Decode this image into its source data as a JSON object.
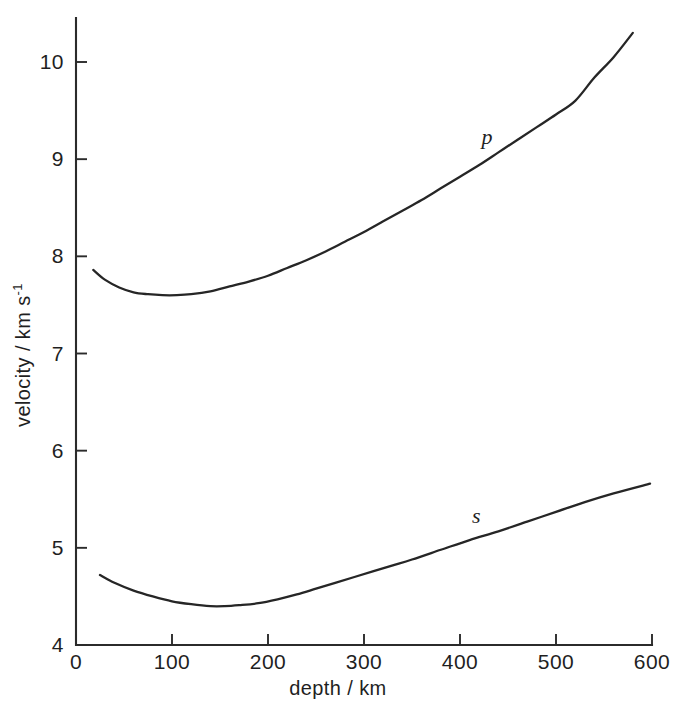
{
  "chart_data": {
    "type": "line",
    "title": "",
    "xlabel": "depth / km",
    "ylabel_main": "velocity / km s",
    "ylabel_exponent": "-1",
    "xlim": [
      0,
      600
    ],
    "ylim": [
      4,
      10.4
    ],
    "xticks": [
      0,
      100,
      200,
      300,
      400,
      500,
      600
    ],
    "xtick_labels": [
      "0",
      "100",
      "200",
      "300",
      "400",
      "500",
      "600"
    ],
    "yticks": [
      4,
      5,
      6,
      7,
      8,
      9,
      10
    ],
    "ytick_labels": [
      "4",
      "5",
      "6",
      "7",
      "8",
      "9",
      "10"
    ],
    "grid": false,
    "legend": "inline-annotations",
    "line_color": "#262626",
    "axis_color": "#2b2b2b",
    "background_color": "#ffffff",
    "annotations": [
      {
        "text": "p",
        "x": 428,
        "y": 9.16,
        "style": "italic"
      },
      {
        "text": "s",
        "x": 417,
        "y": 5.26,
        "style": "italic"
      }
    ],
    "series": [
      {
        "name": "p",
        "label": "p",
        "description": "P-wave velocity versus depth",
        "x": [
          18,
          30,
          45,
          60,
          75,
          90,
          105,
          120,
          140,
          160,
          180,
          200,
          220,
          240,
          260,
          280,
          300,
          320,
          340,
          360,
          380,
          400,
          420,
          440,
          460,
          480,
          500,
          520,
          540,
          560,
          580
        ],
        "y": [
          7.86,
          7.76,
          7.68,
          7.63,
          7.61,
          7.6,
          7.6,
          7.61,
          7.64,
          7.69,
          7.74,
          7.8,
          7.88,
          7.96,
          8.05,
          8.15,
          8.25,
          8.36,
          8.47,
          8.58,
          8.7,
          8.82,
          8.94,
          9.07,
          9.2,
          9.33,
          9.46,
          9.6,
          9.84,
          10.05,
          10.3
        ]
      },
      {
        "name": "s",
        "label": "s",
        "description": "S-wave velocity versus depth",
        "x": [
          25,
          40,
          60,
          80,
          100,
          120,
          140,
          155,
          170,
          190,
          210,
          230,
          250,
          270,
          290,
          310,
          330,
          350,
          380,
          410,
          440,
          470,
          500,
          530,
          560,
          598
        ],
        "y": [
          4.72,
          4.64,
          4.56,
          4.5,
          4.45,
          4.42,
          4.4,
          4.4,
          4.41,
          4.43,
          4.47,
          4.52,
          4.58,
          4.64,
          4.7,
          4.76,
          4.82,
          4.88,
          4.98,
          5.08,
          5.17,
          5.27,
          5.37,
          5.47,
          5.56,
          5.66
        ]
      }
    ]
  },
  "figure": {
    "x_axis_title": "depth / km",
    "y_axis_title_main": "velocity / km s",
    "y_axis_title_sup": "-1"
  }
}
